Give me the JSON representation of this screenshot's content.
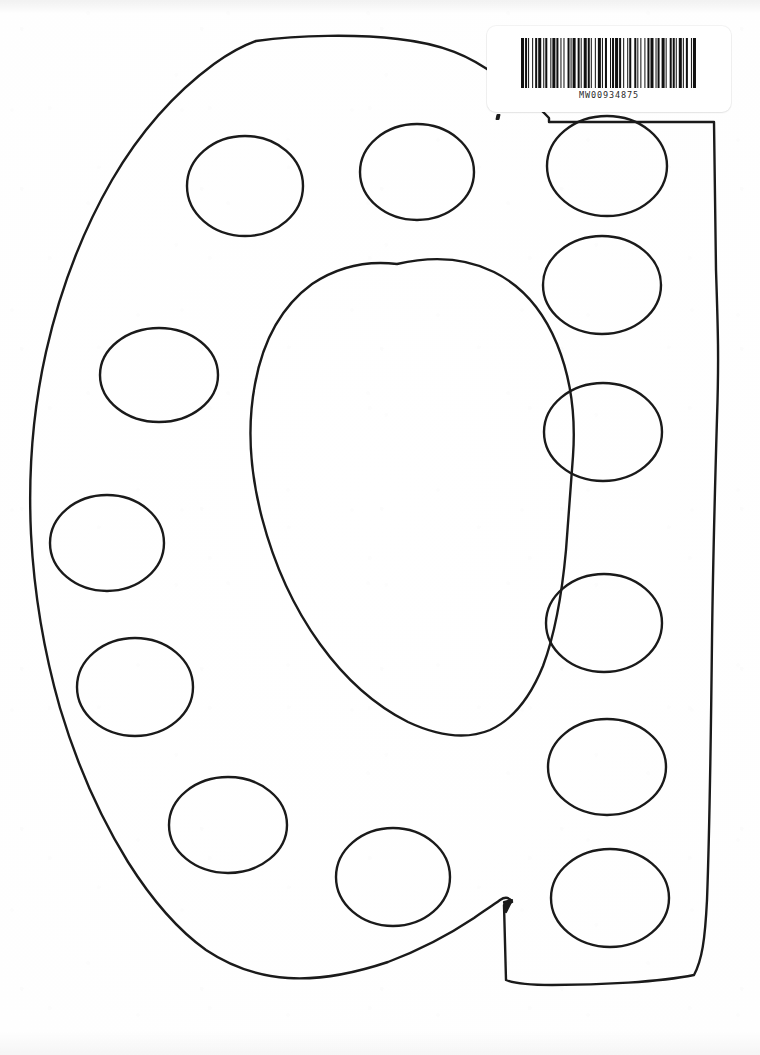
{
  "document": {
    "kind": "scanned-worksheet-page",
    "title": "Polka dot letter Q template",
    "background_color": "#ffffff",
    "ink_color": "#1a1a1a",
    "page_width": 760,
    "page_height": 1055
  },
  "barcode": {
    "label": "MW00934875",
    "sticker_color": "#ffffff",
    "bar_color": "#111111",
    "symbology": "Code 128",
    "bar_pattern": [
      3,
      1,
      2,
      1,
      1,
      3,
      1,
      2,
      2,
      1,
      3,
      2,
      1,
      1,
      2,
      3,
      1,
      1,
      3,
      1,
      2,
      2,
      1,
      2,
      1,
      3,
      2,
      1,
      1,
      1,
      3,
      2,
      2,
      1,
      1,
      2,
      3,
      1,
      2,
      1,
      1,
      3,
      1,
      2,
      3,
      1,
      1,
      2,
      2,
      3,
      1,
      1,
      2,
      1,
      3,
      1,
      2,
      2,
      1,
      3,
      1,
      1,
      2,
      3,
      2,
      1,
      1,
      2,
      1,
      3,
      1,
      2,
      2,
      1,
      3,
      2,
      1,
      1,
      2,
      2,
      3,
      1,
      1,
      3,
      2,
      1,
      2,
      1,
      1,
      2,
      3,
      1,
      1,
      2,
      2,
      3,
      1,
      1,
      3,
      1
    ]
  },
  "artwork": {
    "name": "letter-q-outline-with-polka-dots",
    "letter": "Q",
    "stroke_width": 2.4,
    "outline_path": "M 256 41 C 300 35, 356 34, 398 39 C 443 44, 470 56, 497 76 C 519 92, 536 104, 549 118 L 549 122 L 714 122 L 716 270 C 718 330, 719 360, 717 418 C 715 486, 713 560, 712 640 C 711 730, 710 820, 707 900 C 705 940, 702 960, 694 975 C 660 982, 600 985, 552 985 C 531 985, 515 984, 506 980 L 504 905 L 512 902 C 510 898, 506 896, 500 900 C 492 906, 485 910, 474 918 C 450 934, 420 950, 388 962 C 352 974, 318 980, 288 978 C 258 976, 230 966, 206 950 C 178 930, 152 900, 128 862 C 102 820, 78 768, 60 708 C 44 652, 34 592, 31 534 C 28 470, 33 410, 46 352 C 60 290, 82 232, 112 180 C 140 132, 176 92, 214 64 C 228 54, 242 46, 256 41 Z",
    "inner_path": "M 382 267 C 412 259, 440 257, 466 263 C 492 269, 512 282, 530 302 C 548 322, 561 346, 571 376 C 580 404, 526 336, 530 370 L 527 432 L 521 508 C 518 560, 514 608, 508 646 C 502 682, 492 706, 476 720 C 458 736, 434 740, 408 734 C 380 728, 352 712, 326 686 C 300 660, 278 624, 262 582 C 246 540, 240 494, 244 448 C 248 400, 262 356, 286 320 C 310 286, 342 270, 382 267 Z",
    "inner_path_simple": "M 397 264 C 432 256, 466 258, 494 272 C 522 286, 543 310, 557 344 C 570 376, 576 414, 573 456 L 566 550 C 562 594, 555 634, 543 666 C 530 698, 512 720, 490 730 C 466 740, 438 736, 408 722 C 376 706, 346 680, 320 644 C 294 608, 274 564, 262 518 C 250 472, 247 426, 255 384 C 263 340, 282 306, 312 284 C 336 268, 364 260, 397 264 Z",
    "tail_path": "M 504 902 L 512 900 L 506 912 Z",
    "dots": [
      {
        "name": "dot-top-left",
        "cx": 245,
        "cy": 186,
        "rx": 58,
        "ry": 50
      },
      {
        "name": "dot-top-center",
        "cx": 417,
        "cy": 172,
        "rx": 57,
        "ry": 48
      },
      {
        "name": "dot-top-right",
        "cx": 607,
        "cy": 166,
        "rx": 60,
        "ry": 50
      },
      {
        "name": "dot-left-upper",
        "cx": 159,
        "cy": 375,
        "rx": 59,
        "ry": 47
      },
      {
        "name": "dot-right-upper",
        "cx": 602,
        "cy": 285,
        "rx": 59,
        "ry": 49
      },
      {
        "name": "dot-left-mid",
        "cx": 107,
        "cy": 543,
        "rx": 57,
        "ry": 48
      },
      {
        "name": "dot-right-mid",
        "cx": 603,
        "cy": 432,
        "rx": 59,
        "ry": 49
      },
      {
        "name": "dot-left-lower",
        "cx": 135,
        "cy": 687,
        "rx": 58,
        "ry": 49
      },
      {
        "name": "dot-right-lower",
        "cx": 604,
        "cy": 623,
        "rx": 58,
        "ry": 49
      },
      {
        "name": "dot-bottom-left",
        "cx": 228,
        "cy": 825,
        "rx": 59,
        "ry": 48
      },
      {
        "name": "dot-right-lower-2",
        "cx": 607,
        "cy": 767,
        "rx": 59,
        "ry": 48
      },
      {
        "name": "dot-bottom-center",
        "cx": 393,
        "cy": 877,
        "rx": 57,
        "ry": 49
      },
      {
        "name": "dot-right-bottom",
        "cx": 610,
        "cy": 898,
        "rx": 59,
        "ry": 49
      }
    ],
    "dot_count": 13
  }
}
